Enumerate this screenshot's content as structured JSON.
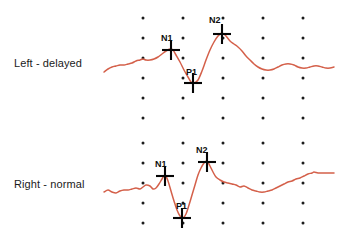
{
  "figure": {
    "kind": "vep-waveform-figure",
    "background": "#ffffff",
    "wave_color": "#d4604a",
    "grid_dot_color": "#1b1b1b",
    "marker_color": "#050505"
  },
  "traces": [
    {
      "id": "left",
      "label": "Left - delayed",
      "label_x": 14,
      "label_y": 57,
      "markers": [
        {
          "name": "N1",
          "label": "N1",
          "cross_x": 171,
          "cross_y": 50,
          "label_x": 161,
          "label_y": 33
        },
        {
          "name": "P1",
          "label": "P1",
          "cross_x": 193,
          "cross_y": 83,
          "label_x": 186,
          "label_y": 67
        },
        {
          "name": "N2",
          "label": "N2",
          "cross_x": 222,
          "cross_y": 34,
          "label_x": 209,
          "label_y": 15
        }
      ]
    },
    {
      "id": "right",
      "label": "Right - normal",
      "label_x": 14,
      "label_y": 178,
      "markers": [
        {
          "name": "N1",
          "label": "N1",
          "cross_x": 165,
          "cross_y": 176,
          "label_x": 155,
          "label_y": 159
        },
        {
          "name": "P1",
          "label": "P1",
          "cross_x": 182,
          "cross_y": 218,
          "label_x": 176,
          "label_y": 201
        },
        {
          "name": "N2",
          "label": "N2",
          "cross_x": 207,
          "cross_y": 162,
          "label_x": 196,
          "label_y": 145
        }
      ]
    }
  ],
  "chart_data": {
    "type": "line",
    "title": "",
    "xlabel": "",
    "ylabel": "",
    "grid": "dot-matrix",
    "legend": "none",
    "xlim": [
      95,
      338
    ],
    "ylim": [
      0,
      247
    ],
    "grid_dots": {
      "columns": [
        143,
        183,
        223,
        263,
        303
      ],
      "rows_upper": [
        18,
        38,
        58,
        78,
        98,
        118
      ],
      "rows_lower": [
        143,
        163,
        183,
        203,
        223
      ],
      "radius": 1.5
    },
    "annotations": [
      {
        "text": "Left - delayed",
        "x": 14,
        "y": 57
      },
      {
        "text": "Right - normal",
        "x": 14,
        "y": 178
      },
      {
        "text": "N1",
        "x": 161,
        "y": 33
      },
      {
        "text": "P1",
        "x": 186,
        "y": 67
      },
      {
        "text": "N2",
        "x": 209,
        "y": 15
      },
      {
        "text": "N1",
        "x": 155,
        "y": 159
      },
      {
        "text": "P1",
        "x": 176,
        "y": 201
      },
      {
        "text": "N2",
        "x": 196,
        "y": 145
      }
    ],
    "series": [
      {
        "name": "Left - delayed",
        "stroke": "#d4604a",
        "stroke_width": 1.5,
        "points": [
          [
            104,
            72
          ],
          [
            108,
            69
          ],
          [
            112,
            67
          ],
          [
            116,
            66
          ],
          [
            120,
            65
          ],
          [
            124,
            65
          ],
          [
            128,
            64
          ],
          [
            132,
            63
          ],
          [
            136,
            61
          ],
          [
            140,
            60
          ],
          [
            143,
            59
          ],
          [
            146,
            60
          ],
          [
            150,
            60
          ],
          [
            154,
            59
          ],
          [
            158,
            57
          ],
          [
            162,
            54
          ],
          [
            166,
            51
          ],
          [
            170,
            49
          ],
          [
            173,
            50
          ],
          [
            176,
            55
          ],
          [
            180,
            62
          ],
          [
            184,
            70
          ],
          [
            188,
            77
          ],
          [
            191,
            82
          ],
          [
            194,
            83
          ],
          [
            198,
            80
          ],
          [
            202,
            71
          ],
          [
            206,
            60
          ],
          [
            210,
            50
          ],
          [
            214,
            42
          ],
          [
            218,
            36
          ],
          [
            222,
            33
          ],
          [
            226,
            36
          ],
          [
            230,
            41
          ],
          [
            234,
            44
          ],
          [
            238,
            47
          ],
          [
            242,
            51
          ],
          [
            246,
            56
          ],
          [
            250,
            60
          ],
          [
            254,
            64
          ],
          [
            258,
            67
          ],
          [
            262,
            69
          ],
          [
            266,
            70
          ],
          [
            270,
            70
          ],
          [
            274,
            69
          ],
          [
            278,
            67
          ],
          [
            282,
            65
          ],
          [
            286,
            64
          ],
          [
            290,
            64
          ],
          [
            294,
            65
          ],
          [
            298,
            67
          ],
          [
            302,
            68
          ],
          [
            306,
            68
          ],
          [
            310,
            67
          ],
          [
            314,
            66
          ],
          [
            318,
            66
          ],
          [
            322,
            67
          ],
          [
            326,
            68
          ],
          [
            330,
            68
          ],
          [
            334,
            67
          ]
        ]
      },
      {
        "name": "Right - normal",
        "stroke": "#d4604a",
        "stroke_width": 1.5,
        "points": [
          [
            104,
            192
          ],
          [
            108,
            190
          ],
          [
            112,
            192
          ],
          [
            116,
            193
          ],
          [
            120,
            191
          ],
          [
            124,
            190
          ],
          [
            128,
            190
          ],
          [
            132,
            189
          ],
          [
            136,
            188
          ],
          [
            140,
            189
          ],
          [
            143,
            187
          ],
          [
            146,
            185
          ],
          [
            150,
            186
          ],
          [
            153,
            189
          ],
          [
            156,
            188
          ],
          [
            159,
            184
          ],
          [
            162,
            179
          ],
          [
            165,
            175
          ],
          [
            168,
            181
          ],
          [
            171,
            191
          ],
          [
            174,
            201
          ],
          [
            177,
            210
          ],
          [
            180,
            216
          ],
          [
            183,
            218
          ],
          [
            186,
            214
          ],
          [
            189,
            205
          ],
          [
            192,
            195
          ],
          [
            195,
            185
          ],
          [
            198,
            175
          ],
          [
            201,
            168
          ],
          [
            204,
            163
          ],
          [
            207,
            161
          ],
          [
            210,
            166
          ],
          [
            213,
            172
          ],
          [
            216,
            177
          ],
          [
            220,
            180
          ],
          [
            224,
            182
          ],
          [
            228,
            183
          ],
          [
            232,
            184
          ],
          [
            236,
            185
          ],
          [
            240,
            187
          ],
          [
            244,
            186
          ],
          [
            248,
            188
          ],
          [
            252,
            190
          ],
          [
            256,
            191
          ],
          [
            260,
            192
          ],
          [
            264,
            192
          ],
          [
            268,
            191
          ],
          [
            272,
            190
          ],
          [
            276,
            188
          ],
          [
            280,
            186
          ],
          [
            284,
            184
          ],
          [
            288,
            182
          ],
          [
            292,
            181
          ],
          [
            296,
            179
          ],
          [
            300,
            178
          ],
          [
            304,
            176
          ],
          [
            308,
            174
          ],
          [
            312,
            173
          ],
          [
            314,
            172
          ],
          [
            318,
            173
          ],
          [
            322,
            173
          ],
          [
            326,
            173
          ],
          [
            330,
            173
          ],
          [
            334,
            173
          ]
        ]
      }
    ]
  }
}
